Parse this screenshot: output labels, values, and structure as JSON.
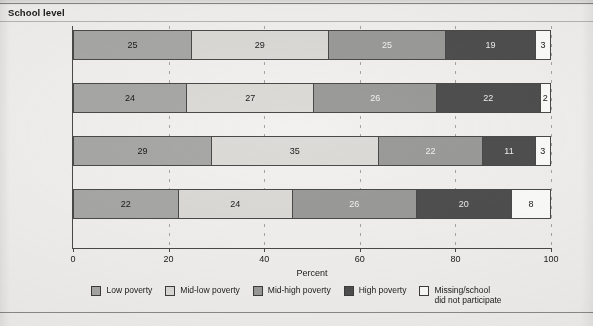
{
  "title": "School level",
  "axis": {
    "xlabel": "Percent",
    "ticks": [
      "0",
      "20",
      "40",
      "60",
      "80",
      "100"
    ]
  },
  "legend": [
    {
      "label": "Low poverty",
      "color": "#a8a8a6"
    },
    {
      "label": "Mid-low poverty",
      "color": "#dcdbd7"
    },
    {
      "label": "Mid-high poverty",
      "color": "#9b9b99"
    },
    {
      "label": "High poverty",
      "color": "#4f4f4f"
    },
    {
      "label": "Missing/school\ndid not participate",
      "color": "#fdfdfb"
    }
  ],
  "rows": [
    {
      "category": "Total",
      "values": [
        "25",
        "29",
        "25",
        "19",
        "3"
      ]
    },
    {
      "category": "Elementary",
      "values": [
        "24",
        "27",
        "26",
        "22",
        "2"
      ]
    },
    {
      "category": "Secondary",
      "values": [
        "29",
        "35",
        "22",
        "11",
        "3"
      ]
    },
    {
      "category": "Combined",
      "values": [
        "22",
        "24",
        "26",
        "20",
        "8"
      ]
    }
  ],
  "chart_data": {
    "type": "bar",
    "orientation": "horizontal",
    "stacked": true,
    "title": "School level",
    "xlabel": "Percent",
    "ylabel": "",
    "xlim": [
      0,
      100
    ],
    "xticks": [
      0,
      20,
      40,
      60,
      80,
      100
    ],
    "grid": "vertical-dashed",
    "legend_position": "bottom-center",
    "categories": [
      "Total",
      "Elementary",
      "Secondary",
      "Combined"
    ],
    "series": [
      {
        "name": "Low poverty",
        "color": "#a8a8a6",
        "values": [
          25,
          24,
          29,
          22
        ]
      },
      {
        "name": "Mid-low poverty",
        "color": "#dcdbd7",
        "values": [
          29,
          27,
          35,
          24
        ]
      },
      {
        "name": "Mid-high poverty",
        "color": "#9b9b99",
        "values": [
          25,
          26,
          22,
          26
        ]
      },
      {
        "name": "High poverty",
        "color": "#4f4f4f",
        "values": [
          19,
          22,
          11,
          20
        ]
      },
      {
        "name": "Missing/school did not participate",
        "color": "#fdfdfb",
        "values": [
          3,
          2,
          3,
          8
        ]
      }
    ]
  }
}
